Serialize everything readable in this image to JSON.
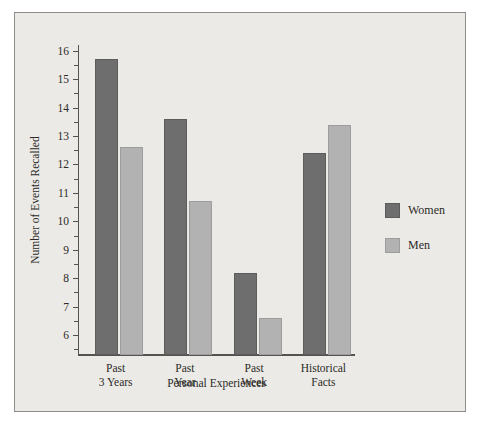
{
  "chart_data": {
    "type": "bar",
    "title": "",
    "xlabel": "Personal Experiences",
    "ylabel": "Number of Events Recalled",
    "categories": [
      "Past 3 Years",
      "Past Year",
      "Past Week",
      "Historical Facts"
    ],
    "category_lines": [
      [
        "Past",
        "3 Years"
      ],
      [
        "Past",
        "Year"
      ],
      [
        "Past",
        "Week"
      ],
      [
        "Historical",
        "Facts"
      ]
    ],
    "series": [
      {
        "name": "Women",
        "color": "#6e6e6e",
        "values": [
          15.7,
          13.6,
          8.2,
          12.4
        ]
      },
      {
        "name": "Men",
        "color": "#b2b2b2",
        "values": [
          12.6,
          10.7,
          6.6,
          13.4
        ]
      }
    ],
    "ylim": [
      5.3,
      16.2
    ],
    "yticks": [
      6,
      7,
      8,
      9,
      10,
      11,
      12,
      13,
      14,
      15,
      16
    ],
    "ytick_labels": [
      "6",
      "7",
      "8",
      "9",
      "10",
      "11",
      "12",
      "13",
      "14",
      "15",
      "16"
    ],
    "minor_yticks": [
      5.5,
      6.5,
      7.5,
      8.5,
      9.5,
      10.5,
      11.5,
      12.5,
      13.5,
      14.5,
      15.5
    ],
    "grid": false,
    "legend_position": "right"
  },
  "legend": {
    "entries": [
      {
        "label": "Women"
      },
      {
        "label": "Men"
      }
    ]
  }
}
